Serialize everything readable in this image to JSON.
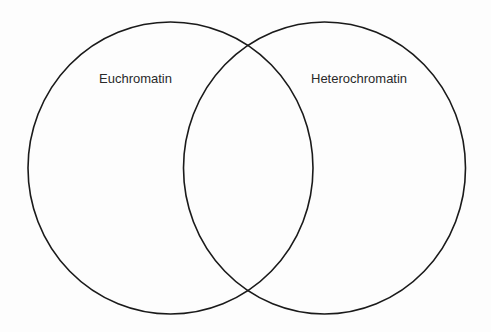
{
  "diagram": {
    "type": "venn",
    "sets": [
      {
        "label": "Euchromatin",
        "cx": 170.5,
        "cy": 168,
        "rx": 142.5,
        "ry": 146
      },
      {
        "label": "Heterochromatin",
        "cx": 324.5,
        "cy": 168,
        "rx": 141,
        "ry": 146
      }
    ],
    "stroke_color": "#1a1a1a",
    "background_color": "#fdfdfd"
  }
}
